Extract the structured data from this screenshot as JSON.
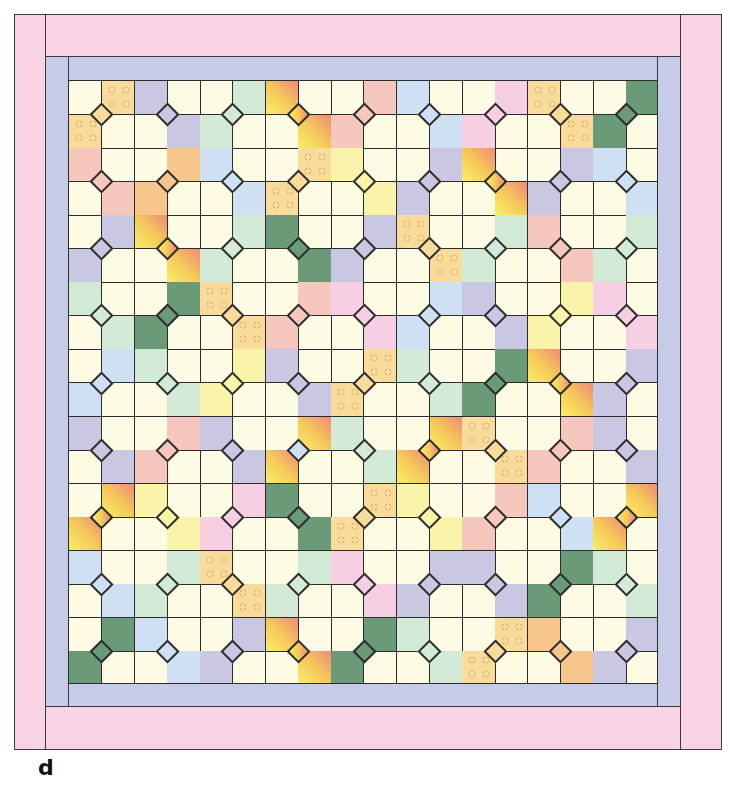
{
  "figure": {
    "label": "d"
  },
  "palette": {
    "background_cell": "#fdfbe4",
    "outline": "#2b2b2b",
    "inner_border": "#c6cbe7",
    "outer_border": "#f8d3e3",
    "Y": {
      "name": "yellow-dotted",
      "color": "#f9dc9c",
      "dotted": true
    },
    "P": {
      "name": "lavender",
      "color": "#cac7e3"
    },
    "G": {
      "name": "mint-green",
      "color": "#d3ebd6"
    },
    "D": {
      "name": "dark-green",
      "color": "#6b9a78"
    },
    "K": {
      "name": "salmon",
      "color": "#f5c7bd"
    },
    "N": {
      "name": "pink",
      "color": "#f6cfe2"
    },
    "O": {
      "name": "orange",
      "color": "#f7c68c"
    },
    "L": {
      "name": "lemon",
      "color": "#faf3aa"
    },
    "B": {
      "name": "light-blue",
      "color": "#cfe0f3"
    },
    "S": {
      "name": "sunset-gradient",
      "gradient": "linear-gradient(225deg, #ee8a7a 0%, #f5c85a 50%, #f7ef6a 100%)"
    }
  },
  "grid": {
    "columns": 18,
    "rows": 18,
    "diamond_rows": [
      {
        "row": 1,
        "diamonds": [
          "Y",
          "P",
          "G",
          "S",
          "K",
          "B",
          "N",
          "Y",
          "D"
        ]
      },
      {
        "row": 3,
        "diamonds": [
          "K",
          "O",
          "B",
          "Y",
          "L",
          "P",
          "S",
          "P",
          "B"
        ]
      },
      {
        "row": 5,
        "diamonds": [
          "P",
          "S",
          "G",
          "D",
          "P",
          "Y",
          "G",
          "K",
          "G"
        ]
      },
      {
        "row": 7,
        "diamonds": [
          "G",
          "D",
          "Y",
          "K",
          "N",
          "B",
          "P",
          "L",
          "N"
        ]
      },
      {
        "row": 9,
        "diamonds": [
          "B",
          "G",
          "L",
          "P",
          "Y",
          "G",
          "D",
          "S",
          "P"
        ]
      },
      {
        "row": 11,
        "diamonds": [
          "P",
          "K",
          "P",
          "S",
          "G",
          "S",
          "Y",
          "K",
          "P"
        ],
        "diamond_overrides": {
          "3": "B"
        }
      },
      {
        "row": 13,
        "diamonds": [
          "S",
          "L",
          "N",
          "D",
          "Y",
          "L",
          "K",
          "B",
          "S"
        ]
      },
      {
        "row": 15,
        "diamonds": [
          "B",
          "G",
          "Y",
          "G",
          "N",
          "P",
          "P",
          "D",
          "G"
        ]
      },
      {
        "row": 17,
        "diamonds": [
          "D",
          "B",
          "P",
          "S",
          "D",
          "G",
          "Y",
          "O",
          "P"
        ]
      }
    ]
  }
}
